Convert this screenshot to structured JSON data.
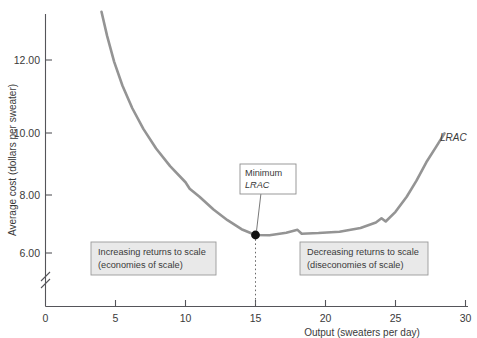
{
  "chart_data": {
    "type": "line",
    "title": "",
    "xlabel": "Output (sweaters per day)",
    "ylabel": "Average cost (dollars per sweater)",
    "xlim": [
      0,
      31
    ],
    "ylim": [
      5.45,
      13.6
    ],
    "grid": false,
    "legend_position": "none",
    "y_axis_break": true,
    "xticks": [
      0,
      5,
      10,
      15,
      20,
      25,
      30
    ],
    "xtick_labels": [
      "0",
      "5",
      "10",
      "15",
      "20",
      "25",
      "30"
    ],
    "yticks": [
      8.0,
      10.0,
      12.0
    ],
    "ytick_labels": [
      "8.00",
      "10.00",
      "12.00"
    ],
    "series": [
      {
        "name": "LRAC",
        "color": "#949494",
        "points": [
          [
            4.0,
            13.5
          ],
          [
            4.4,
            12.75
          ],
          [
            4.9,
            11.95
          ],
          [
            5.5,
            11.2
          ],
          [
            6.2,
            10.5
          ],
          [
            7.0,
            9.85
          ],
          [
            7.9,
            9.25
          ],
          [
            8.9,
            8.7
          ],
          [
            10.0,
            8.2
          ],
          [
            10.3,
            8.0
          ],
          [
            11.0,
            7.75
          ],
          [
            12.0,
            7.35
          ],
          [
            13.0,
            7.02
          ],
          [
            14.0,
            6.74
          ],
          [
            15.0,
            6.56
          ],
          [
            16.0,
            6.55
          ],
          [
            17.2,
            6.63
          ],
          [
            18.0,
            6.72
          ],
          [
            18.3,
            6.6
          ],
          [
            19.5,
            6.62
          ],
          [
            21.0,
            6.66
          ],
          [
            22.5,
            6.78
          ],
          [
            23.6,
            6.95
          ],
          [
            24.0,
            7.08
          ],
          [
            24.3,
            6.98
          ],
          [
            25.0,
            7.28
          ],
          [
            25.8,
            7.75
          ],
          [
            26.5,
            8.25
          ],
          [
            27.2,
            8.82
          ],
          [
            27.9,
            9.3
          ],
          [
            28.5,
            9.72
          ]
        ]
      }
    ],
    "minimum_point": {
      "x": 15.0,
      "y": 6.56,
      "label_line1": "Minimum",
      "label_line2": "LRAC"
    },
    "curve_end_label": "LRAC",
    "annotations": [
      {
        "id": "increasing-returns",
        "line1": "Increasing returns to scale",
        "line2": "(economies of scale)"
      },
      {
        "id": "decreasing-returns",
        "line1": "Decreasing returns to scale",
        "line2": "(diseconomies of scale)"
      }
    ]
  },
  "colors": {
    "curve": "#949494",
    "axis": "#55555a",
    "text": "#3a3a3a",
    "annotation_fill": "#e9e9e9",
    "annotation_border": "#9a9a9a",
    "marker": "#111111",
    "background": "#ffffff"
  }
}
